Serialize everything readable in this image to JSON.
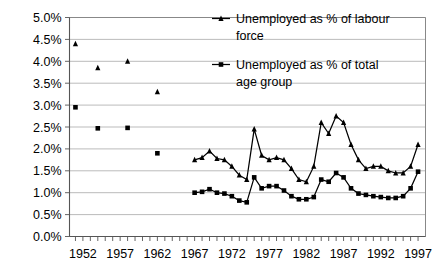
{
  "chart_data": {
    "type": "line",
    "title": "",
    "subtitle": "",
    "xlabel": "",
    "ylabel": "",
    "xlim": [
      1950.2,
      1998.0
    ],
    "ylim": [
      0.0,
      5.0
    ],
    "y_tick_labels": [
      "0.0%",
      "0.5%",
      "1.0%",
      "1.5%",
      "2.0%",
      "2.5%",
      "3.0%",
      "3.5%",
      "4.0%",
      "4.5%",
      "5.0%"
    ],
    "y_tick_values": [
      0.0,
      0.5,
      1.0,
      1.5,
      2.0,
      2.5,
      3.0,
      3.5,
      4.0,
      4.5,
      5.0
    ],
    "x_tick_labels": [
      "1952",
      "1957",
      "1962",
      "1967",
      "1972",
      "1977",
      "1982",
      "1987",
      "1992",
      "1997"
    ],
    "x_tick_values": [
      1952,
      1957,
      1962,
      1967,
      1972,
      1977,
      1982,
      1987,
      1992,
      1997
    ],
    "x_minor_ticks_every": 1,
    "grid": "horizontal",
    "legend_position": "top-right-inside",
    "series": [
      {
        "name": "Unemployed as % of labour force",
        "marker": "triangle",
        "color": "#000000",
        "segments": [
          {
            "connected": false,
            "x": [
              1951,
              1954,
              1958,
              1962
            ],
            "values": [
              4.4,
              3.85,
              4.0,
              3.3
            ]
          },
          {
            "connected": true,
            "x": [
              1967,
              1968,
              1969,
              1970,
              1971,
              1972,
              1973,
              1974,
              1975,
              1976,
              1977,
              1978,
              1979,
              1980,
              1981,
              1982,
              1983,
              1984,
              1985,
              1986,
              1987,
              1988,
              1989,
              1990,
              1991,
              1992,
              1993,
              1994,
              1995,
              1996,
              1997
            ],
            "values": [
              1.75,
              1.8,
              1.95,
              1.78,
              1.75,
              1.6,
              1.4,
              1.3,
              2.45,
              1.85,
              1.75,
              1.8,
              1.75,
              1.55,
              1.3,
              1.25,
              1.6,
              2.6,
              2.35,
              2.75,
              2.6,
              2.1,
              1.75,
              1.55,
              1.6,
              1.6,
              1.5,
              1.45,
              1.45,
              1.6,
              2.1,
              2.55
            ]
          }
        ]
      },
      {
        "name": "Unemployed as % of total age group",
        "marker": "square",
        "color": "#000000",
        "segments": [
          {
            "connected": false,
            "x": [
              1951,
              1954,
              1958,
              1962
            ],
            "values": [
              2.95,
              2.47,
              2.48,
              1.9
            ]
          },
          {
            "connected": true,
            "x": [
              1967,
              1968,
              1969,
              1970,
              1971,
              1972,
              1973,
              1974,
              1975,
              1976,
              1977,
              1978,
              1979,
              1980,
              1981,
              1982,
              1983,
              1984,
              1985,
              1986,
              1987,
              1988,
              1989,
              1990,
              1991,
              1992,
              1993,
              1994,
              1995,
              1996,
              1997
            ],
            "values": [
              1.0,
              1.02,
              1.08,
              1.0,
              0.98,
              0.92,
              0.82,
              0.78,
              1.35,
              1.1,
              1.15,
              1.15,
              1.05,
              0.92,
              0.85,
              0.85,
              0.9,
              1.3,
              1.25,
              1.45,
              1.35,
              1.1,
              0.98,
              0.95,
              0.92,
              0.9,
              0.88,
              0.88,
              0.92,
              1.1,
              1.48,
              1.5
            ]
          }
        ]
      }
    ]
  },
  "legend": {
    "entries": [
      {
        "label_line1": "Unemployed as % of labour",
        "label_line2": "force",
        "marker": "triangle"
      },
      {
        "label_line1": "Unemployed as % of total",
        "label_line2": "age group",
        "marker": "square"
      }
    ]
  },
  "icons": {
    "triangle_marker": "triangle-marker-icon",
    "square_marker": "square-marker-icon"
  }
}
